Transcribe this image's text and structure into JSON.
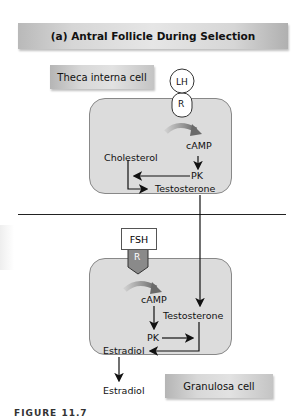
{
  "title": "(a) Antral Follicle During Selection",
  "theca": {
    "label": "Theca interna cell",
    "hormone": "LH",
    "receptor": "R",
    "camp": "cAMP",
    "pk": "PK",
    "cholesterol": "Cholesterol",
    "testosterone": "Testosterone"
  },
  "granulosa": {
    "label": "Granulosa cell",
    "hormone": "FSH",
    "receptor": "R",
    "camp": "cAMP",
    "pk": "PK",
    "testosterone": "Testosterone",
    "estradiol_inside": "Estradiol",
    "estradiol_outside": "Estradiol"
  },
  "caption": "FIGURE 11.7"
}
